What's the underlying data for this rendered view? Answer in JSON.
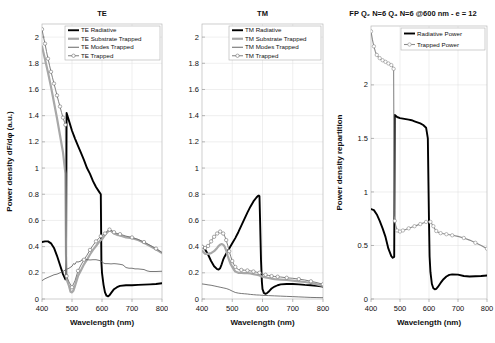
{
  "figure": {
    "xlabel": "Wavelength (nm)",
    "ylabel_left": "Power density dF/dφ (a.u.)",
    "ylabel_right": "Power density repartition"
  },
  "chart_data": [
    {
      "type": "line",
      "id": "te",
      "title": "TE",
      "xlabel": "Wavelength (nm)",
      "ylabel": "Power density dF/dφ (a.u.)",
      "xlim": [
        400,
        800
      ],
      "ylim": [
        0,
        2.1
      ],
      "xticks": [
        400,
        500,
        600,
        700,
        800
      ],
      "yticks": [
        0,
        0.2,
        0.4,
        0.6,
        0.8,
        1,
        1.2,
        1.4,
        1.6,
        1.8,
        2
      ],
      "ytick_labels": [
        "0",
        "0.2",
        "0.4",
        "0.6",
        "0.8",
        "1",
        "1.2",
        "1.4",
        "1.6",
        "1.8",
        "2"
      ],
      "grid": true,
      "legend_position": "top-right",
      "series": [
        {
          "name": "TE Radiative",
          "color": "#000000",
          "width": 1.9,
          "marker": "none",
          "x": [
            400,
            410,
            420,
            430,
            440,
            450,
            460,
            470,
            478,
            480,
            482,
            490,
            500,
            510,
            520,
            530,
            540,
            550,
            560,
            570,
            580,
            590,
            596,
            598,
            600,
            605,
            610,
            615,
            620,
            625,
            630,
            640,
            650,
            660,
            680,
            700,
            720,
            740,
            760,
            780,
            800
          ],
          "y": [
            0.435,
            0.44,
            0.44,
            0.425,
            0.39,
            0.33,
            0.26,
            0.19,
            0.15,
            0.15,
            1.42,
            1.36,
            1.285,
            1.225,
            1.17,
            1.115,
            1.06,
            1.0,
            0.955,
            0.9,
            0.855,
            0.82,
            0.8,
            0.28,
            0.2,
            0.11,
            0.05,
            0.025,
            0.02,
            0.028,
            0.045,
            0.075,
            0.09,
            0.1,
            0.105,
            0.105,
            0.108,
            0.11,
            0.112,
            0.115,
            0.12
          ]
        },
        {
          "name": "TE Substrate Trapped",
          "color": "#a8a8a8",
          "width": 2.2,
          "marker": "none",
          "x": [
            400,
            410,
            420,
            430,
            440,
            450,
            460,
            470,
            478,
            480,
            482,
            490,
            495,
            500,
            505,
            510,
            520,
            530,
            540,
            550,
            560,
            570,
            580,
            590,
            596,
            600,
            610,
            620,
            625,
            630,
            640,
            650,
            660,
            680,
            700,
            720,
            740,
            760,
            780,
            800
          ],
          "y": [
            1.93,
            1.83,
            1.73,
            1.62,
            1.5,
            1.38,
            1.25,
            1.12,
            0.96,
            0.34,
            0.15,
            0.1,
            0.055,
            0.05,
            0.065,
            0.1,
            0.175,
            0.22,
            0.265,
            0.3,
            0.34,
            0.375,
            0.405,
            0.435,
            0.45,
            0.455,
            0.49,
            0.515,
            0.525,
            0.52,
            0.5,
            0.49,
            0.485,
            0.47,
            0.465,
            0.45,
            0.43,
            0.405,
            0.38,
            0.35
          ]
        },
        {
          "name": "TE Modes Trapped",
          "color": "#555555",
          "width": 0.8,
          "marker": "none",
          "x": [
            400,
            410,
            420,
            430,
            440,
            450,
            460,
            470,
            480,
            490,
            500,
            505,
            510,
            515,
            520,
            530,
            535,
            540,
            550,
            560,
            570,
            580,
            590,
            596,
            600,
            605,
            610,
            620,
            630,
            640,
            650,
            660,
            670,
            680,
            690,
            700,
            710,
            720,
            740,
            750,
            760,
            780,
            800
          ],
          "y": [
            0.14,
            0.155,
            0.165,
            0.175,
            0.185,
            0.19,
            0.2,
            0.21,
            0.225,
            0.235,
            0.25,
            0.27,
            0.265,
            0.285,
            0.282,
            0.29,
            0.305,
            0.3,
            0.3,
            0.298,
            0.3,
            0.3,
            0.295,
            0.29,
            0.285,
            0.275,
            0.27,
            0.27,
            0.268,
            0.27,
            0.268,
            0.265,
            0.26,
            0.24,
            0.235,
            0.235,
            0.23,
            0.23,
            0.225,
            0.215,
            0.21,
            0.21,
            0.212
          ]
        },
        {
          "name": "TE Trapped",
          "color": "#707070",
          "width": 0.9,
          "marker": "circle",
          "marker_size": 1.7,
          "x": [
            400,
            405,
            410,
            415,
            420,
            425,
            430,
            435,
            440,
            445,
            450,
            455,
            460,
            465,
            470,
            475,
            478,
            480,
            482,
            490,
            500,
            510,
            520,
            530,
            540,
            550,
            560,
            570,
            580,
            590,
            596,
            600,
            610,
            620,
            625,
            630,
            640,
            650,
            660,
            680,
            700,
            720,
            740,
            760,
            780,
            800
          ],
          "y": [
            2.06,
            2.0,
            1.95,
            1.89,
            1.835,
            1.785,
            1.735,
            1.69,
            1.645,
            1.6,
            1.555,
            1.51,
            1.47,
            1.425,
            1.385,
            1.35,
            1.33,
            0.35,
            0.175,
            0.13,
            0.09,
            0.14,
            0.215,
            0.26,
            0.3,
            0.335,
            0.375,
            0.41,
            0.44,
            0.465,
            0.48,
            0.485,
            0.5,
            0.525,
            0.53,
            0.525,
            0.51,
            0.5,
            0.495,
            0.48,
            0.47,
            0.455,
            0.435,
            0.41,
            0.385,
            0.355
          ]
        }
      ]
    },
    {
      "type": "line",
      "id": "tm",
      "title": "TM",
      "xlabel": "Wavelength (nm)",
      "ylabel": "",
      "xlim": [
        400,
        800
      ],
      "ylim": [
        0,
        2.1
      ],
      "xticks": [
        400,
        500,
        600,
        700,
        800
      ],
      "yticks": [
        0,
        0.2,
        0.4,
        0.6,
        0.8,
        1,
        1.2,
        1.4,
        1.6,
        1.8,
        2
      ],
      "ytick_labels": [
        "0",
        "0.2",
        "0.4",
        "0.6",
        "0.8",
        "1",
        "1.2",
        "1.4",
        "1.6",
        "1.8",
        "2"
      ],
      "grid": true,
      "legend_position": "top-right",
      "series": [
        {
          "name": "TM Radiative",
          "color": "#000000",
          "width": 1.9,
          "marker": "none",
          "x": [
            400,
            410,
            420,
            430,
            440,
            450,
            455,
            460,
            465,
            470,
            475,
            480,
            490,
            500,
            510,
            520,
            530,
            540,
            550,
            560,
            570,
            580,
            585,
            588,
            590,
            592,
            595,
            598,
            600,
            605,
            610,
            615,
            620,
            625,
            630,
            640,
            650,
            660,
            680,
            700,
            720,
            740,
            760,
            780,
            800
          ],
          "y": [
            0.405,
            0.38,
            0.34,
            0.29,
            0.25,
            0.228,
            0.225,
            0.235,
            0.265,
            0.3,
            0.325,
            0.345,
            0.385,
            0.425,
            0.465,
            0.51,
            0.56,
            0.61,
            0.66,
            0.705,
            0.745,
            0.775,
            0.787,
            0.79,
            0.785,
            0.6,
            0.3,
            0.13,
            0.075,
            0.045,
            0.04,
            0.045,
            0.055,
            0.068,
            0.08,
            0.095,
            0.105,
            0.112,
            0.115,
            0.115,
            0.112,
            0.108,
            0.105,
            0.1,
            0.095
          ]
        },
        {
          "name": "TM Substrate Trapped",
          "color": "#a8a8a8",
          "width": 2.2,
          "marker": "none",
          "x": [
            400,
            410,
            420,
            430,
            440,
            450,
            455,
            460,
            465,
            470,
            475,
            480,
            485,
            490,
            495,
            500,
            505,
            510,
            520,
            530,
            540,
            550,
            560,
            570,
            580,
            590,
            600,
            610,
            620,
            630,
            640,
            650,
            660,
            680,
            700,
            720,
            740,
            760,
            780,
            800
          ],
          "y": [
            0.37,
            0.345,
            0.345,
            0.35,
            0.365,
            0.39,
            0.405,
            0.415,
            0.42,
            0.415,
            0.4,
            0.37,
            0.33,
            0.295,
            0.265,
            0.245,
            0.225,
            0.21,
            0.2,
            0.2,
            0.198,
            0.198,
            0.195,
            0.19,
            0.185,
            0.18,
            0.17,
            0.165,
            0.16,
            0.155,
            0.152,
            0.15,
            0.148,
            0.145,
            0.14,
            0.135,
            0.13,
            0.122,
            0.112,
            0.1
          ]
        },
        {
          "name": "TM Modes Trapped",
          "color": "#555555",
          "width": 0.8,
          "marker": "none",
          "x": [
            400,
            410,
            420,
            430,
            440,
            450,
            460,
            470,
            480,
            490,
            500,
            510,
            520,
            530,
            540,
            550,
            560,
            570,
            580,
            590,
            600,
            620,
            640,
            660,
            680,
            700,
            720,
            740,
            760,
            780,
            800
          ],
          "y": [
            0.115,
            0.112,
            0.108,
            0.105,
            0.1,
            0.095,
            0.09,
            0.085,
            0.08,
            0.072,
            0.06,
            0.05,
            0.045,
            0.042,
            0.04,
            0.038,
            0.035,
            0.033,
            0.031,
            0.03,
            0.028,
            0.026,
            0.024,
            0.022,
            0.02,
            0.018,
            0.016,
            0.014,
            0.012,
            0.011,
            0.01
          ]
        },
        {
          "name": "TM Trapped",
          "color": "#707070",
          "width": 0.9,
          "marker": "circle",
          "marker_size": 1.7,
          "x": [
            400,
            405,
            410,
            415,
            420,
            425,
            430,
            435,
            440,
            445,
            450,
            455,
            460,
            465,
            470,
            475,
            480,
            485,
            490,
            495,
            500,
            505,
            510,
            520,
            530,
            540,
            550,
            560,
            570,
            580,
            590,
            600,
            610,
            620,
            630,
            640,
            650,
            660,
            680,
            700,
            720,
            740,
            760,
            780,
            800
          ],
          "y": [
            0.4,
            0.395,
            0.39,
            0.395,
            0.405,
            0.42,
            0.44,
            0.46,
            0.475,
            0.49,
            0.5,
            0.51,
            0.515,
            0.512,
            0.5,
            0.48,
            0.45,
            0.41,
            0.365,
            0.325,
            0.29,
            0.265,
            0.245,
            0.225,
            0.222,
            0.22,
            0.218,
            0.215,
            0.21,
            0.205,
            0.2,
            0.19,
            0.185,
            0.18,
            0.175,
            0.172,
            0.17,
            0.168,
            0.162,
            0.158,
            0.152,
            0.145,
            0.135,
            0.125,
            0.112
          ]
        }
      ]
    },
    {
      "type": "line",
      "id": "fp",
      "title": "FP Q₂ N=6 Q₄ N=6 @600 nm - e = 12",
      "xlabel": "Wavelength (nm)",
      "ylabel": "Power density repartition",
      "xlim": [
        400,
        800
      ],
      "ylim": [
        0,
        2.55
      ],
      "xticks": [
        400,
        500,
        600,
        700,
        800
      ],
      "yticks": [
        0,
        0.5,
        1,
        1.5,
        2
      ],
      "ytick_labels": [
        "0",
        "0.5",
        "1",
        "1.5",
        "2"
      ],
      "grid": true,
      "legend_position": "top-right",
      "series": [
        {
          "name": "Radiative Power",
          "color": "#000000",
          "width": 1.9,
          "marker": "none",
          "x": [
            400,
            410,
            420,
            430,
            440,
            450,
            460,
            470,
            475,
            478,
            480,
            482,
            490,
            500,
            510,
            520,
            530,
            540,
            550,
            560,
            570,
            580,
            590,
            596,
            598,
            600,
            602,
            605,
            610,
            615,
            620,
            625,
            630,
            640,
            650,
            660,
            670,
            680,
            700,
            720,
            740,
            760,
            780,
            800
          ],
          "y": [
            0.84,
            0.83,
            0.79,
            0.73,
            0.66,
            0.58,
            0.47,
            0.4,
            0.385,
            0.39,
            0.395,
            1.72,
            1.7,
            1.69,
            1.685,
            1.68,
            1.675,
            1.67,
            1.66,
            1.65,
            1.64,
            1.625,
            1.6,
            1.5,
            1.1,
            0.72,
            0.4,
            0.25,
            0.14,
            0.1,
            0.09,
            0.095,
            0.11,
            0.15,
            0.185,
            0.21,
            0.225,
            0.23,
            0.228,
            0.215,
            0.21,
            0.212,
            0.215,
            0.22
          ]
        },
        {
          "name": "Trapped Power",
          "color": "#8a8a8a",
          "width": 1.1,
          "marker": "circle",
          "marker_size": 1.7,
          "x": [
            400,
            405,
            410,
            415,
            420,
            425,
            430,
            435,
            440,
            445,
            450,
            455,
            460,
            465,
            470,
            475,
            478,
            480,
            482,
            485,
            490,
            495,
            500,
            505,
            510,
            520,
            530,
            540,
            550,
            560,
            570,
            580,
            590,
            600,
            605,
            610,
            615,
            620,
            625,
            630,
            640,
            650,
            660,
            670,
            680,
            700,
            720,
            740,
            760,
            780,
            800
          ],
          "y": [
            2.5,
            2.42,
            2.36,
            2.31,
            2.28,
            2.26,
            2.25,
            2.24,
            2.23,
            2.22,
            2.215,
            2.21,
            2.2,
            2.195,
            2.185,
            2.17,
            2.15,
            0.78,
            0.73,
            0.69,
            0.64,
            0.625,
            0.63,
            0.635,
            0.64,
            0.65,
            0.66,
            0.67,
            0.68,
            0.69,
            0.7,
            0.71,
            0.72,
            0.725,
            0.72,
            0.7,
            0.68,
            0.655,
            0.635,
            0.625,
            0.615,
            0.61,
            0.605,
            0.6,
            0.595,
            0.585,
            0.57,
            0.55,
            0.525,
            0.5,
            0.47
          ]
        }
      ]
    }
  ]
}
